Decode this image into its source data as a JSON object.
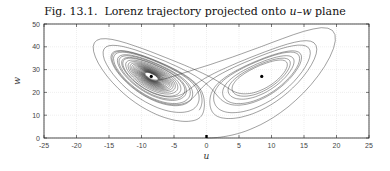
{
  "title": {
    "prefix": "Fig. 13.1.",
    "text": "Lorenz trajectory projected onto",
    "var1": "u",
    "dash": "–",
    "var2": "w",
    "suffix": "plane"
  },
  "chart_data": {
    "type": "line",
    "xlabel": "u",
    "ylabel": "w",
    "xlim": [
      -25,
      25
    ],
    "ylim": [
      0,
      50
    ],
    "xticks": [
      -25,
      -20,
      -15,
      -10,
      -5,
      0,
      5,
      10,
      15,
      20,
      25
    ],
    "yticks": [
      0,
      10,
      20,
      30,
      40,
      50
    ],
    "grid": true,
    "legend": null,
    "series": [
      {
        "name": "trajectory",
        "description": "Lorenz attractor (sigma=10, rho=28, beta=8/3) projected onto u-w plane, starting near origin",
        "color": "#333333"
      }
    ],
    "fixed_points": [
      {
        "u": -8.5,
        "w": 27
      },
      {
        "u": 8.5,
        "w": 27
      }
    ],
    "start_point": {
      "u": 0,
      "w": 0
    }
  },
  "colors": {
    "line": "#333333",
    "axis": "#222222",
    "grid": "#e4e4e4",
    "marker": "#000000"
  }
}
